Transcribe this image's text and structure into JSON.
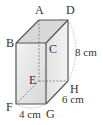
{
  "diagram": {
    "type": "rectangular-prism",
    "vertices": {
      "A": "A",
      "B": "B",
      "C": "C",
      "D": "D",
      "E": "E",
      "F": "F",
      "G": "G",
      "H": "H"
    },
    "dimensions": {
      "height": "8 cm",
      "depth": "6 cm",
      "width": "4 cm"
    },
    "colors": {
      "edge": "#555555",
      "hidden_edge": "#777777",
      "face_front": "#e6e6e6",
      "face_top": "#d4d4d4",
      "face_right": "#dcdcdc",
      "arc": "#999999"
    }
  }
}
